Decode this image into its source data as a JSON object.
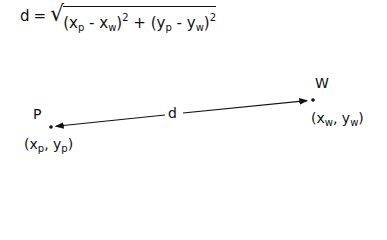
{
  "formula": {
    "lhs": "d",
    "equals": "=",
    "term1": {
      "open": "(",
      "a": "x",
      "a_sub": "p",
      "minus": "-",
      "b": "x",
      "b_sub": "w",
      "close": ")",
      "exp": "2"
    },
    "plus": "+",
    "term2": {
      "open": "(",
      "a": "y",
      "a_sub": "p",
      "minus": "-",
      "b": "y",
      "b_sub": "w",
      "close": ")",
      "exp": "2"
    }
  },
  "points": {
    "p": {
      "label": "P",
      "coord_open": "(",
      "x": "x",
      "x_sub": "p",
      "sep": ",",
      "y": "y",
      "y_sub": "p",
      "coord_close": ")"
    },
    "w": {
      "label": "W",
      "coord_open": "(",
      "x": "x",
      "x_sub": "w",
      "sep": ",",
      "y": "y",
      "y_sub": "w",
      "coord_close": ")"
    }
  },
  "distance_label": "d",
  "icons": {
    "arrow": "double-headed-arrow"
  }
}
